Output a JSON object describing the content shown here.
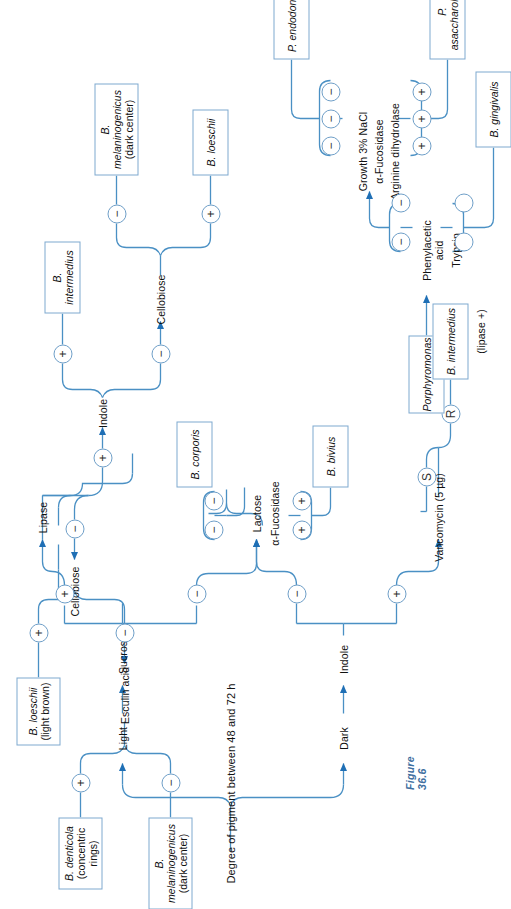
{
  "figure": {
    "caption": "Figure 36.6",
    "root_label": "Degree of pigment between 48 and 72 h",
    "line_color": "#4a90c4",
    "arrow_color": "#1f6fb5",
    "box_border_color": "#7ea9cf"
  },
  "branches": {
    "light": "Light",
    "dark": "Dark"
  },
  "tests": {
    "sucrose": "Sucrose",
    "lipase": "Lipase",
    "cellobiose_a": "Cellobiose",
    "indole_a": "Indole",
    "esculin_acid": "Esculin acid",
    "cellobiose_b": "Cellobiose",
    "lactose": "Lactose",
    "fucosidase": "α-Fucosidase",
    "indole_b": "Indole",
    "vancomycin": "Vancomycin (5 µg)",
    "phenylacetic_acid": "Phenylacetic\nacid",
    "trypsin": "Trypsin",
    "growth_nacl": "Growth 3% NaCl",
    "fucosidase2": "α-Fucosidase",
    "arginine": "Arginine dihydrolase"
  },
  "test_labels": {
    "phenylacetic_line1": "Phenylacetic",
    "phenylacetic_line2": "acid",
    "trypsin": "Trypsin",
    "growth_nacl": "Growth 3% NaCl",
    "fucosidase2": "α-Fucosidase",
    "arginine": "Arginine dihydrolase",
    "lactose": "Lactose",
    "fucosidase": "α-Fucosidase"
  },
  "symbols": {
    "plus": "+",
    "minus": "−",
    "s": "S",
    "r": "R",
    "blank": ""
  },
  "organisms": {
    "loeschii_light_brown": {
      "name": "B. loeschii",
      "note": "(light brown)"
    },
    "denticola": {
      "name": "B. denticola",
      "note": "(concentric rings)"
    },
    "melaninogenicus_dark_1": {
      "name": "B. melaninogenicus",
      "note": "(dark center)"
    },
    "intermedius_top": {
      "name": "B. intermedius",
      "note": ""
    },
    "melaninogenicus_dark_2": {
      "name": "B. melaninogenicus",
      "note": "(dark center)"
    },
    "loeschii": {
      "name": "B. loeschii",
      "note": ""
    },
    "corporis": {
      "name": "B. corporis",
      "note": ""
    },
    "bivius": {
      "name": "B. bivius",
      "note": ""
    },
    "porphyromonas": {
      "name": "Porphyromonas",
      "note": ""
    },
    "intermedius_lipase": {
      "name": "B. intermedius",
      "note": ""
    },
    "intermedius_lipase_sub": "(lipase +)",
    "gingivalis": {
      "name": "B. gingivalis",
      "note": ""
    },
    "asaccharolyticus": {
      "name": "P. asaccharolyticus",
      "note": ""
    },
    "endodontalis": {
      "name": "P. endodontalis",
      "note": ""
    }
  },
  "symbol_groups": {
    "corporis": [
      "−",
      "−"
    ],
    "bivius": [
      "+",
      "+"
    ],
    "gingivalis": [
      "",
      ""
    ],
    "endodontalis": [
      "−",
      "−",
      "−"
    ],
    "asaccharolyticus": [
      "+",
      "+",
      "+"
    ],
    "phenyl_minus": [
      "−",
      "−"
    ]
  }
}
